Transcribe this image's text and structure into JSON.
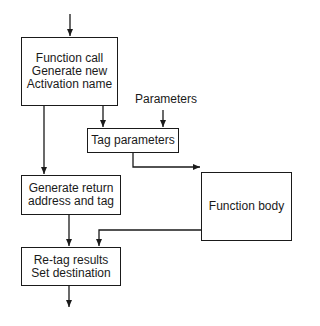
{
  "diagram": {
    "type": "flowchart",
    "nodes": {
      "function_call": {
        "lines": [
          "Function call",
          "Generate new",
          "Activation name"
        ]
      },
      "tag_parameters": {
        "lines": [
          "Tag parameters"
        ]
      },
      "function_body": {
        "lines": [
          "Function body"
        ]
      },
      "generate_return": {
        "lines": [
          "Generate return",
          "address and tag"
        ]
      },
      "retag_results": {
        "lines": [
          "Re-tag results",
          "Set destination"
        ]
      }
    },
    "inputs": {
      "parameters": "Parameters"
    },
    "edges": [
      [
        "entry",
        "function_call"
      ],
      [
        "function_call",
        "tag_parameters"
      ],
      [
        "function_call",
        "generate_return"
      ],
      [
        "parameters",
        "tag_parameters"
      ],
      [
        "tag_parameters",
        "function_body"
      ],
      [
        "generate_return",
        "retag_results"
      ],
      [
        "function_body",
        "retag_results"
      ],
      [
        "retag_results",
        "exit"
      ]
    ],
    "colors": {
      "stroke": "#1a1a1a",
      "background": "#ffffff"
    }
  }
}
